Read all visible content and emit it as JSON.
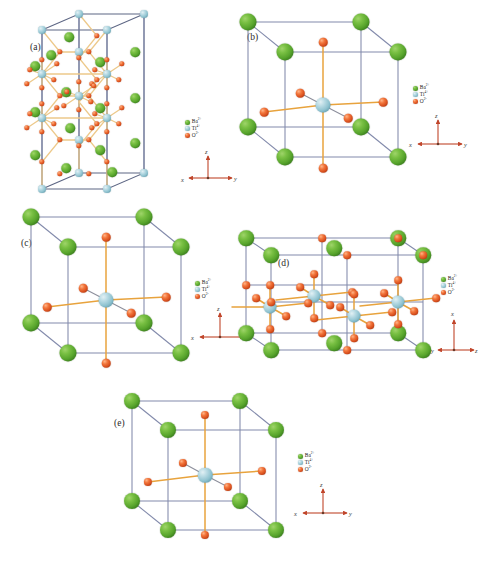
{
  "figure": {
    "background_color": "#ffffff"
  },
  "species": {
    "barium": {
      "key": "Ba",
      "label": "Ba",
      "charge": "2+",
      "color": "#57a42c",
      "legend_label": "Ba2+"
    },
    "titanium": {
      "key": "Ti",
      "label": "Ti",
      "charge": "4+",
      "color": "#8ec2cf",
      "legend_label": "Ti4+"
    },
    "oxygen": {
      "key": "O",
      "label": "O",
      "charge": "2-",
      "color": "#d9501e",
      "legend_label": "O2-"
    }
  },
  "colors": {
    "cell_edge": "#828aab",
    "cell_edge_dark": "#5d6684",
    "bond": "#e8a33d",
    "bond_pale": "#edc98a",
    "axis": "#c0452a",
    "axis_text": "#3a3a3a"
  },
  "legend": {
    "rows": [
      {
        "species": "Ba",
        "element": "Ba",
        "charge": "2+",
        "color": "#57a42c"
      },
      {
        "species": "Ti",
        "element": "Ti",
        "charge": "4+",
        "color": "#8ec2cf"
      },
      {
        "species": "O",
        "element": "O",
        "charge": "2-",
        "color": "#d9501e"
      }
    ]
  },
  "panels": [
    {
      "id": "a",
      "label": "(a)",
      "structure": "hexagonal",
      "description": "Tall hexagonal cell with face-sharing TiO6 octahedra",
      "axes": {
        "up": "z",
        "right": "y",
        "left_down": "x"
      }
    },
    {
      "id": "b",
      "label": "(b)",
      "structure": "cubic",
      "description": "Cubic perovskite unit cell with central TiO6 octahedron",
      "axes": {
        "up": "z",
        "right": "y",
        "left_down": "x"
      }
    },
    {
      "id": "c",
      "label": "(c)",
      "structure": "tetragonal",
      "description": "Tetragonal perovskite unit cell with central TiO6 octahedron",
      "axes": {
        "up": "z",
        "right": "y",
        "left_down": "x"
      }
    },
    {
      "id": "d",
      "label": "(d)",
      "structure": "orthorhombic-supercell",
      "description": "Supercell with multiple Ti sites viewed along a rotated orientation",
      "axes": {
        "up": "x",
        "right": "z",
        "left_down": "y"
      }
    },
    {
      "id": "e",
      "label": "(e)",
      "structure": "rhombohedral",
      "description": "Rhombohedral perovskite unit cell with central TiO6 octahedron",
      "axes": {
        "up": "z",
        "right": "y",
        "left_down": "x"
      }
    }
  ],
  "axis_labels": {
    "x": "x",
    "y": "y",
    "z": "z"
  }
}
